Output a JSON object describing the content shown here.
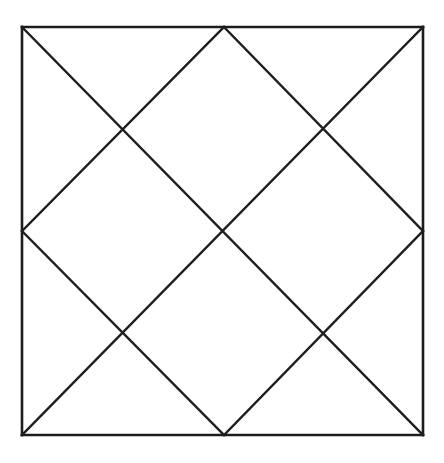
{
  "figure": {
    "background_color": "#ffffff",
    "stroke_color": "#1c1c1c",
    "stroke_width": 2.5,
    "canvas": {
      "width": 444,
      "height": 463
    }
  },
  "chart_data": {
    "type": "diagram",
    "coordinate_space": {
      "x_min": 0,
      "y_min": 0,
      "x_max": 444,
      "y_max": 463
    },
    "square": {
      "name": "outer-square",
      "top_left": [
        22,
        27
      ],
      "top_right": [
        423,
        27
      ],
      "bottom_right": [
        423,
        435
      ],
      "bottom_left": [
        22,
        435
      ],
      "width": 401,
      "height": 408
    },
    "key_points": {
      "top_mid": [
        224,
        27
      ],
      "bottom_mid": [
        224,
        435
      ],
      "left_mid": [
        22,
        231
      ],
      "right_mid": [
        423,
        231
      ],
      "center": [
        224,
        231
      ],
      "upper_left_node": [
        124,
        129
      ],
      "upper_right_node": [
        323,
        129
      ],
      "lower_left_node": [
        124,
        333
      ],
      "lower_right_node": [
        323,
        333
      ]
    },
    "segments": [
      {
        "name": "square-top-edge",
        "from": [
          22,
          27
        ],
        "to": [
          423,
          27
        ]
      },
      {
        "name": "square-right-edge",
        "from": [
          423,
          27
        ],
        "to": [
          423,
          435
        ]
      },
      {
        "name": "square-bottom-edge",
        "from": [
          423,
          435
        ],
        "to": [
          22,
          435
        ]
      },
      {
        "name": "square-left-edge",
        "from": [
          22,
          435
        ],
        "to": [
          22,
          27
        ]
      },
      {
        "name": "diagonal-top-left-to-bottom-right",
        "from": [
          22,
          27
        ],
        "to": [
          423,
          435
        ]
      },
      {
        "name": "diagonal-top-right-to-bottom-left",
        "from": [
          423,
          27
        ],
        "to": [
          22,
          435
        ]
      },
      {
        "name": "diagonal-left-mid-to-top-mid",
        "from": [
          22,
          231
        ],
        "to": [
          224,
          27
        ]
      },
      {
        "name": "diagonal-top-mid-to-right-mid",
        "from": [
          224,
          27
        ],
        "to": [
          423,
          231
        ]
      },
      {
        "name": "diagonal-left-mid-to-bottom-mid",
        "from": [
          22,
          231
        ],
        "to": [
          224,
          435
        ]
      },
      {
        "name": "diagonal-bottom-mid-to-right-mid",
        "from": [
          224,
          435
        ],
        "to": [
          423,
          231
        ]
      }
    ],
    "counts": {
      "line_segments": 10,
      "intersection_nodes": 5,
      "enclosed_regions": 12
    }
  }
}
